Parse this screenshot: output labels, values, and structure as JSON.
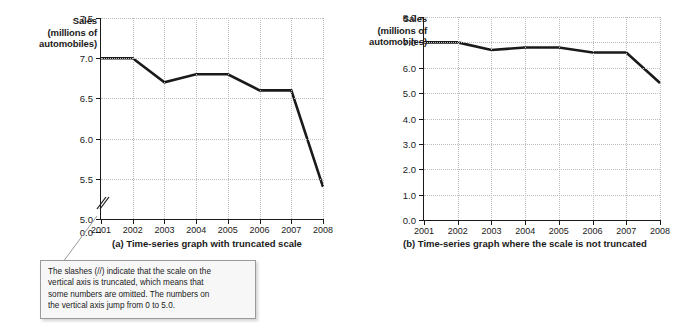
{
  "figure": {
    "panels": [
      {
        "id": "a",
        "axis_title_lines": [
          "Sales",
          "(millions of",
          "automobiles)"
        ],
        "caption": "(a) Time-series graph with truncated scale",
        "truncated": true,
        "break_marker": "//"
      },
      {
        "id": "b",
        "axis_title_lines": [
          "Sales",
          "(millions of",
          "automobiles)"
        ],
        "caption": "(b) Time-series graph where the scale is not truncated",
        "truncated": false
      }
    ]
  },
  "callout": {
    "lines": [
      "The slashes (//) indicate that the scale on the",
      "vertical axis is truncated, which means that",
      "some numbers are omitted.  The numbers on",
      "the vertical axis jump from 0 to 5.0."
    ]
  },
  "chart_data": [
    {
      "type": "line",
      "title": "(a) Time-series graph with truncated scale",
      "xlabel": "",
      "ylabel": "Sales (millions of automobiles)",
      "categories": [
        "2001",
        "2002",
        "2003",
        "2004",
        "2005",
        "2006",
        "2007",
        "2008"
      ],
      "values": [
        7.0,
        7.0,
        6.7,
        6.8,
        6.8,
        6.6,
        6.6,
        5.4
      ],
      "ylim": [
        5.0,
        7.5
      ],
      "yticks": [
        "0.0",
        "5.0",
        "5.5",
        "6.0",
        "6.5",
        "7.0",
        "7.5"
      ],
      "ytick_values": [
        0.0,
        5.0,
        5.5,
        6.0,
        6.5,
        7.0,
        7.5
      ],
      "axis_truncated": true,
      "grid": true,
      "legend": "none"
    },
    {
      "type": "line",
      "title": "(b) Time-series graph where the scale is not truncated",
      "xlabel": "",
      "ylabel": "Sales (millions of automobiles)",
      "categories": [
        "2001",
        "2002",
        "2003",
        "2004",
        "2005",
        "2006",
        "2007",
        "2008"
      ],
      "values": [
        7.0,
        7.0,
        6.7,
        6.8,
        6.8,
        6.6,
        6.6,
        5.4
      ],
      "ylim": [
        0.0,
        8.0
      ],
      "yticks": [
        "0.0",
        "1.0",
        "2.0",
        "3.0",
        "4.0",
        "5.0",
        "6.0",
        "7.0",
        "8.0"
      ],
      "ytick_values": [
        0.0,
        1.0,
        2.0,
        3.0,
        4.0,
        5.0,
        6.0,
        7.0,
        8.0
      ],
      "axis_truncated": false,
      "grid": true,
      "legend": "none"
    }
  ],
  "colors": {
    "line": "#1a1a1a",
    "grid": "#bdbdbd",
    "axis": "#1a1a1a",
    "callout_bg": "#f7f7f7",
    "callout_border": "#9a9a9a"
  }
}
